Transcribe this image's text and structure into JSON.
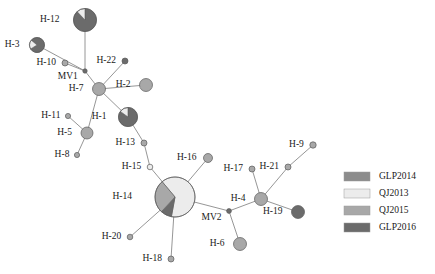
{
  "figure": {
    "type": "haplotype-network",
    "width": 435,
    "height": 274,
    "background": "#ffffff"
  },
  "palette": {
    "GLP2014": "#8c8c8c",
    "QJ2013": "#ececec",
    "QJ2015": "#a8a8a8",
    "GLP2016": "#6b6b6b",
    "edge": "#8a8a8a",
    "outline": "#5a5a5a",
    "text": "#1a1a1a"
  },
  "legend": {
    "position": "right",
    "x": 344,
    "y": 172,
    "swatch_width": 26,
    "swatch_height": 9,
    "row_gap": 17,
    "items": [
      {
        "label": "GLP2014",
        "color": "#8c8c8c"
      },
      {
        "label": "QJ2013",
        "color": "#ececec"
      },
      {
        "label": "QJ2015",
        "color": "#a8a8a8"
      },
      {
        "label": "GLP2016",
        "color": "#6b6b6b"
      }
    ]
  },
  "chart_data": {
    "type": "network",
    "title": "",
    "nodes": [
      {
        "id": "H-12",
        "label": "H-12",
        "x": 85,
        "y": 20,
        "r": 11.5,
        "label_dx": -14,
        "label_dy": 0,
        "anchor": "end",
        "slices": [
          {
            "pop": "GLP2016",
            "value": 88
          },
          {
            "pop": "QJ2013",
            "value": 12
          }
        ],
        "start_angle": 0
      },
      {
        "id": "H-3",
        "label": "H-3",
        "x": 37,
        "y": 45,
        "r": 7.5,
        "label_dx": -10,
        "label_dy": 0,
        "anchor": "end",
        "slices": [
          {
            "pop": "GLP2016",
            "value": 80
          },
          {
            "pop": "QJ2013",
            "value": 20
          }
        ],
        "start_angle": 310
      },
      {
        "id": "H-10",
        "label": "H-10",
        "x": 65,
        "y": 63,
        "r": 3.0,
        "label_dx": -6,
        "label_dy": 0,
        "anchor": "end",
        "slices": [
          {
            "pop": "QJ2015",
            "value": 100
          }
        ],
        "start_angle": 0
      },
      {
        "id": "MV1",
        "label": "MV1",
        "x": 85,
        "y": 71,
        "r": 2.2,
        "label_dx": -5,
        "label_dy": 6,
        "anchor": "end",
        "slices": [
          {
            "pop": "GLP2016",
            "value": 100
          }
        ],
        "start_angle": 0
      },
      {
        "id": "H-22",
        "label": "H-22",
        "x": 125,
        "y": 61,
        "r": 3.0,
        "label_dx": -6,
        "label_dy": 0,
        "anchor": "end",
        "slices": [
          {
            "pop": "GLP2016",
            "value": 100
          }
        ],
        "start_angle": 0
      },
      {
        "id": "H-7",
        "label": "H-7",
        "x": 99,
        "y": 89,
        "r": 6.5,
        "label_dx": -9,
        "label_dy": 0,
        "anchor": "end",
        "slices": [
          {
            "pop": "QJ2015",
            "value": 100
          }
        ],
        "start_angle": 0
      },
      {
        "id": "H-2",
        "label": "H-2",
        "x": 146,
        "y": 85,
        "r": 6.5,
        "label_dx": -9,
        "label_dy": 0,
        "anchor": "end",
        "slices": [
          {
            "pop": "QJ2015",
            "value": 100
          }
        ],
        "start_angle": 0
      },
      {
        "id": "H-1",
        "label": "H-1",
        "x": 128,
        "y": 117,
        "r": 9.5,
        "label_dx": -12,
        "label_dy": 0,
        "anchor": "end",
        "slices": [
          {
            "pop": "GLP2016",
            "value": 85
          },
          {
            "pop": "QJ2013",
            "value": 15
          }
        ],
        "start_angle": 0
      },
      {
        "id": "H-11",
        "label": "H-11",
        "x": 68,
        "y": 116,
        "r": 2.6,
        "label_dx": -5,
        "label_dy": 0,
        "anchor": "end",
        "slices": [
          {
            "pop": "QJ2015",
            "value": 100
          }
        ],
        "start_angle": 0
      },
      {
        "id": "H-5",
        "label": "H-5",
        "x": 87,
        "y": 133,
        "r": 6.0,
        "label_dx": -9,
        "label_dy": 0,
        "anchor": "end",
        "slices": [
          {
            "pop": "QJ2015",
            "value": 100
          }
        ],
        "start_angle": 0
      },
      {
        "id": "H-8",
        "label": "H-8",
        "x": 77,
        "y": 155,
        "r": 2.6,
        "label_dx": -5,
        "label_dy": 0,
        "anchor": "end",
        "slices": [
          {
            "pop": "QJ2015",
            "value": 100
          }
        ],
        "start_angle": 0
      },
      {
        "id": "H-13",
        "label": "H-13",
        "x": 144,
        "y": 143,
        "r": 3.0,
        "label_dx": -6,
        "label_dy": 0,
        "anchor": "end",
        "slices": [
          {
            "pop": "QJ2015",
            "value": 100
          }
        ],
        "start_angle": 0
      },
      {
        "id": "H-15",
        "label": "H-15",
        "x": 150,
        "y": 167,
        "r": 2.8,
        "label_dx": -6,
        "label_dy": 0,
        "anchor": "end",
        "slices": [
          {
            "pop": "QJ2013",
            "value": 100
          }
        ],
        "start_angle": 0
      },
      {
        "id": "H-14",
        "label": "H-14",
        "x": 175,
        "y": 197,
        "r": 20.0,
        "label_dx": -23,
        "label_dy": 0,
        "anchor": "end",
        "slices": [
          {
            "pop": "QJ2013",
            "value": 64
          },
          {
            "pop": "GLP2016",
            "value": 9
          },
          {
            "pop": "QJ2015",
            "value": 27
          }
        ],
        "start_angle": 320
      },
      {
        "id": "H-16",
        "label": "H-16",
        "x": 208,
        "y": 158,
        "r": 4.5,
        "label_dx": -7,
        "label_dy": 0,
        "anchor": "end",
        "slices": [
          {
            "pop": "QJ2015",
            "value": 100
          }
        ],
        "start_angle": 0
      },
      {
        "id": "H-20",
        "label": "H-20",
        "x": 130,
        "y": 237,
        "r": 2.8,
        "label_dx": -6,
        "label_dy": 0,
        "anchor": "end",
        "slices": [
          {
            "pop": "QJ2015",
            "value": 100
          }
        ],
        "start_angle": 0
      },
      {
        "id": "H-18",
        "label": "H-18",
        "x": 171,
        "y": 259,
        "r": 3.0,
        "label_dx": -6,
        "label_dy": 0,
        "anchor": "end",
        "slices": [
          {
            "pop": "QJ2015",
            "value": 100
          }
        ],
        "start_angle": 0
      },
      {
        "id": "MV2",
        "label": "MV2",
        "x": 229,
        "y": 211,
        "r": 2.4,
        "label_dx": -5,
        "label_dy": 7,
        "anchor": "end",
        "slices": [
          {
            "pop": "GLP2016",
            "value": 100
          }
        ],
        "start_angle": 0
      },
      {
        "id": "H-4",
        "label": "H-4",
        "x": 261,
        "y": 199,
        "r": 6.5,
        "label_dx": -9,
        "label_dy": 0,
        "anchor": "end",
        "slices": [
          {
            "pop": "QJ2015",
            "value": 100
          }
        ],
        "start_angle": 0
      },
      {
        "id": "H-17",
        "label": "H-17",
        "x": 252,
        "y": 169,
        "r": 3.0,
        "label_dx": -6,
        "label_dy": 0,
        "anchor": "end",
        "slices": [
          {
            "pop": "QJ2015",
            "value": 100
          }
        ],
        "start_angle": 0
      },
      {
        "id": "H-21",
        "label": "H-21",
        "x": 288,
        "y": 167,
        "r": 3.0,
        "label_dx": -6,
        "label_dy": 0,
        "anchor": "end",
        "slices": [
          {
            "pop": "QJ2015",
            "value": 100
          }
        ],
        "start_angle": 0
      },
      {
        "id": "H-9",
        "label": "H-9",
        "x": 313,
        "y": 145,
        "r": 3.2,
        "label_dx": -6,
        "label_dy": 0,
        "anchor": "end",
        "slices": [
          {
            "pop": "QJ2015",
            "value": 100
          }
        ],
        "start_angle": 0
      },
      {
        "id": "H-19",
        "label": "H-19",
        "x": 298,
        "y": 212,
        "r": 6.5,
        "label_dx": -9,
        "label_dy": 0,
        "anchor": "end",
        "slices": [
          {
            "pop": "GLP2016",
            "value": 100
          }
        ],
        "start_angle": 0
      },
      {
        "id": "H-6",
        "label": "H-6",
        "x": 240,
        "y": 244,
        "r": 6.5,
        "label_dx": -9,
        "label_dy": 0,
        "anchor": "end",
        "slices": [
          {
            "pop": "QJ2015",
            "value": 100
          }
        ],
        "start_angle": 0
      }
    ],
    "edges": [
      {
        "source": "H-12",
        "target": "MV1"
      },
      {
        "source": "H-3",
        "target": "MV1"
      },
      {
        "source": "H-10",
        "target": "MV1"
      },
      {
        "source": "MV1",
        "target": "H-7"
      },
      {
        "source": "H-22",
        "target": "H-7"
      },
      {
        "source": "H-7",
        "target": "H-2"
      },
      {
        "source": "H-7",
        "target": "H-1"
      },
      {
        "source": "H-7",
        "target": "H-5"
      },
      {
        "source": "H-11",
        "target": "H-5"
      },
      {
        "source": "H-5",
        "target": "H-8"
      },
      {
        "source": "H-1",
        "target": "H-13"
      },
      {
        "source": "H-13",
        "target": "H-15"
      },
      {
        "source": "H-15",
        "target": "H-14"
      },
      {
        "source": "H-14",
        "target": "H-16"
      },
      {
        "source": "H-14",
        "target": "H-20"
      },
      {
        "source": "H-14",
        "target": "H-18"
      },
      {
        "source": "H-14",
        "target": "MV2"
      },
      {
        "source": "MV2",
        "target": "H-4"
      },
      {
        "source": "MV2",
        "target": "H-6"
      },
      {
        "source": "H-4",
        "target": "H-17"
      },
      {
        "source": "H-4",
        "target": "H-21"
      },
      {
        "source": "H-4",
        "target": "H-19"
      },
      {
        "source": "H-21",
        "target": "H-9"
      }
    ]
  }
}
